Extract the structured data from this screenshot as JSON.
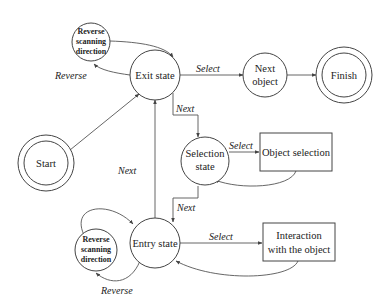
{
  "diagram": {
    "nodes": {
      "reverse_top": {
        "lines": [
          "Reverse",
          "scanning",
          "direction"
        ]
      },
      "exit_state": {
        "label": "Exit state"
      },
      "next_object": {
        "lines": [
          "Next",
          "object"
        ]
      },
      "finish": {
        "label": "Finish"
      },
      "start": {
        "label": "Start"
      },
      "selection_state": {
        "lines": [
          "Selection",
          "state"
        ]
      },
      "object_selection": {
        "label": "Object selection"
      },
      "entry_state": {
        "label": "Entry state"
      },
      "reverse_bottom": {
        "lines": [
          "Reverse",
          "scanning",
          "direction"
        ]
      },
      "interaction": {
        "lines": [
          "Interaction",
          "with the object"
        ]
      }
    },
    "edges": {
      "reverse_top": "Reverse",
      "select_exit_next": "Select",
      "next_exit_selection": "Next",
      "select_selection_object": "Select",
      "next_selection_entry": "Next",
      "next_entry_exit": "Next",
      "select_entry_interaction": "Select",
      "reverse_bottom": "Reverse"
    }
  }
}
